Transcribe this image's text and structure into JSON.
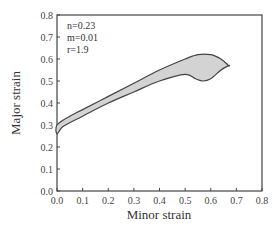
{
  "chart_data": {
    "type": "area",
    "title": "",
    "xlabel": "Minor strain",
    "ylabel": "Major strain",
    "xlim": [
      0.0,
      0.8
    ],
    "ylim": [
      0.0,
      0.8
    ],
    "xticks": [
      "0.0",
      "0.1",
      "0.2",
      "0.3",
      "0.4",
      "0.5",
      "0.6",
      "0.7",
      "0.8"
    ],
    "yticks": [
      "0.0",
      "0.1",
      "0.2",
      "0.3",
      "0.4",
      "0.5",
      "0.6",
      "0.7",
      "0.8"
    ],
    "grid": false,
    "legend": null,
    "annotations": [
      "n=0.23",
      "m=0.01",
      "r=1.9"
    ],
    "series": [
      {
        "name": "upper boundary",
        "x": [
          0.0,
          0.05,
          0.1,
          0.2,
          0.3,
          0.4,
          0.5,
          0.55,
          0.6,
          0.64,
          0.67
        ],
        "y": [
          0.3,
          0.34,
          0.37,
          0.43,
          0.49,
          0.55,
          0.6,
          0.62,
          0.62,
          0.6,
          0.57
        ]
      },
      {
        "name": "lower boundary",
        "x": [
          0.0,
          0.02,
          0.05,
          0.1,
          0.2,
          0.3,
          0.4,
          0.5,
          0.54,
          0.57,
          0.6,
          0.64,
          0.67
        ],
        "y": [
          0.26,
          0.29,
          0.31,
          0.34,
          0.4,
          0.45,
          0.5,
          0.53,
          0.51,
          0.5,
          0.51,
          0.55,
          0.57
        ]
      }
    ],
    "fill_color": "#d3d3d3",
    "line_color": "#444444"
  },
  "annotations": {
    "n": "n=0.23",
    "m": "m=0.01",
    "r": "r=1.9"
  },
  "axes": {
    "xlabel": "Minor strain",
    "ylabel": "Major strain"
  }
}
